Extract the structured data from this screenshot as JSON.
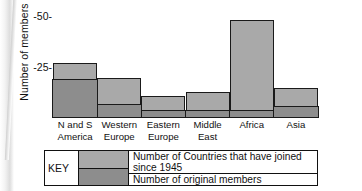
{
  "chart_data": {
    "type": "bar",
    "title": "",
    "subtitle": "",
    "xlabel": "",
    "ylabel": "Number of members",
    "ylim": [
      0,
      55
    ],
    "yticks": [
      25,
      50
    ],
    "ytick_labels": [
      "-25-",
      "-50-"
    ],
    "grid": false,
    "stacked": true,
    "legend_position": "bottom",
    "categories": [
      "N and S America",
      "Western Europe",
      "Eastern Europe",
      "Middle East",
      "Africa",
      "Asia"
    ],
    "category_lines": [
      [
        "N and S",
        "America"
      ],
      [
        "Western",
        "Europe"
      ],
      [
        "Eastern",
        "Europe"
      ],
      [
        "Middle",
        "East"
      ],
      [
        "Africa",
        ""
      ],
      [
        "Asia",
        ""
      ]
    ],
    "series": [
      {
        "name": "Number of Countries that have joined since 1945",
        "color": "#a9a9a9",
        "values": [
          8,
          13,
          7,
          9,
          46,
          9
        ]
      },
      {
        "name": "Number of original members",
        "color": "#8d8d8d",
        "values": [
          20,
          7,
          4,
          4,
          4,
          6
        ]
      }
    ],
    "totals": [
      28,
      20,
      11,
      13,
      50,
      15
    ]
  },
  "legend": {
    "title": "KEY",
    "entries": [
      {
        "label": "Number of Countries that have joined since 1945",
        "color": "#a9a9a9"
      },
      {
        "label": "Number of original members",
        "color": "#8d8d8d"
      }
    ]
  },
  "axis": {
    "y_title": "Number of members",
    "y_tick_top": "-50-",
    "y_tick_mid": "-25-"
  },
  "colors": {
    "joined_since_1945": "#a9a9a9",
    "original_members": "#8d8d8d",
    "outline": "#1a1a1a",
    "background": "#ffffff"
  }
}
